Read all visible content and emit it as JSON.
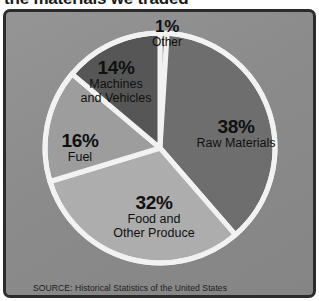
{
  "figure": {
    "title": "the materials we traded",
    "source_note": "SOURCE: Historical Statistics of the United States",
    "frame_color": "#2b2b2b",
    "background_color": "#8d8d8d",
    "divider_color": "#f2f2f2"
  },
  "chart_data": {
    "type": "pie",
    "title": "the materials we traded",
    "xlabel": "",
    "ylabel": "",
    "legend_position": "none",
    "grid": false,
    "unit": "%",
    "categories": [
      "Other",
      "Raw Materials",
      "Food and Other Produce",
      "Fuel",
      "Machines and Vehicles"
    ],
    "values": [
      1,
      38,
      32,
      16,
      14
    ],
    "colors": [
      "#6f6f6f",
      "#6e6e6e",
      "#adadad",
      "#9d9d9d",
      "#565656"
    ],
    "start_angle_deg": 0,
    "direction": "clockwise",
    "slices": [
      {
        "name": "Other",
        "value": 1,
        "pct_label": "1%",
        "name_label": "Other",
        "color": "#6f6f6f"
      },
      {
        "name": "Raw Materials",
        "value": 38,
        "pct_label": "38%",
        "name_label": "Raw Materials",
        "color": "#6e6e6e"
      },
      {
        "name": "Food and Other Produce",
        "value": 32,
        "pct_label": "32%",
        "name_label_line1": "Food and",
        "name_label_line2": "Other Produce",
        "color": "#adadad"
      },
      {
        "name": "Fuel",
        "value": 16,
        "pct_label": "16%",
        "name_label": "Fuel",
        "color": "#9d9d9d"
      },
      {
        "name": "Machines and Vehicles",
        "value": 14,
        "pct_label": "14%",
        "name_label_line1": "Machines",
        "name_label_line2": "and Vehicles",
        "color": "#565656"
      }
    ]
  }
}
